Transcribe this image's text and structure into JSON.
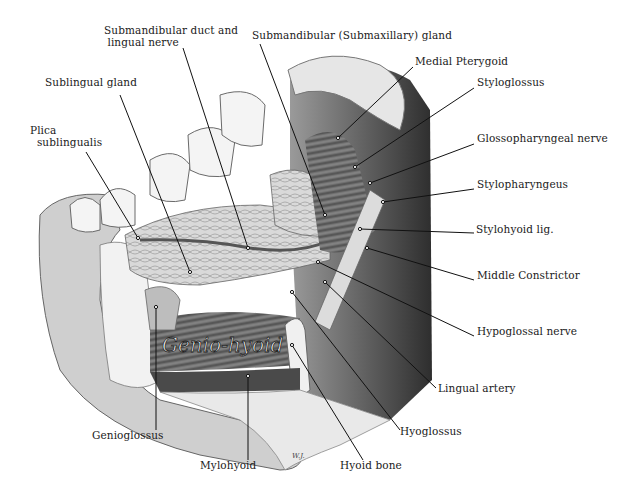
{
  "figure": {
    "painted_label": "Genio-hyoid",
    "signature": "W.J.",
    "colors": {
      "background": "#ffffff",
      "ink": "#1a1a1a",
      "shade_dark": "#3a3a3a",
      "shade_mid": "#8a8a8a",
      "shade_light": "#d6d6d6"
    }
  },
  "labels": [
    {
      "id": "submandibular-duct-lingual-nerve",
      "text": "Submandibular duct and\n lingual nerve",
      "x": 104,
      "y": 30,
      "anchor": [
        248,
        248
      ],
      "from": [
        183,
        48
      ]
    },
    {
      "id": "submandibular-gland",
      "text": "Submandibular (Submaxillary) gland",
      "x": 252,
      "y": 35,
      "anchor": [
        325,
        215
      ],
      "from": [
        260,
        44
      ]
    },
    {
      "id": "sublingual-gland",
      "text": "Sublingual gland",
      "x": 45,
      "y": 82,
      "anchor": [
        190,
        272
      ],
      "from": [
        120,
        95
      ]
    },
    {
      "id": "plica-sublingualis",
      "text": "Plica\n  sublingualis",
      "x": 30,
      "y": 130,
      "anchor": [
        138,
        238
      ],
      "from": [
        86,
        152
      ]
    },
    {
      "id": "medial-pterygoid",
      "text": "Medial Pterygoid",
      "x": 415,
      "y": 61,
      "anchor": [
        338,
        138
      ],
      "from": [
        413,
        67
      ]
    },
    {
      "id": "styloglossus",
      "text": "Styloglossus",
      "x": 477,
      "y": 82,
      "anchor": [
        355,
        167
      ],
      "from": [
        474,
        88
      ]
    },
    {
      "id": "glossopharyngeal-nerve",
      "text": "Glossopharyngeal nerve",
      "x": 477,
      "y": 138,
      "anchor": [
        370,
        183
      ],
      "from": [
        474,
        144
      ]
    },
    {
      "id": "stylopharyngeus",
      "text": "Stylopharyngeus",
      "x": 477,
      "y": 184,
      "anchor": [
        383,
        202
      ],
      "from": [
        474,
        189
      ]
    },
    {
      "id": "stylohoid-lig",
      "text": "Stylohyoid lig.",
      "x": 476,
      "y": 229,
      "anchor": [
        360,
        229
      ],
      "from": [
        474,
        233
      ]
    },
    {
      "id": "middle-constrictor",
      "text": "Middle Constrictor",
      "x": 477,
      "y": 275,
      "anchor": [
        367,
        248
      ],
      "from": [
        474,
        280
      ]
    },
    {
      "id": "hypoglossal-nerve",
      "text": "Hypoglossal nerve",
      "x": 477,
      "y": 331,
      "anchor": [
        318,
        262
      ],
      "from": [
        474,
        336
      ]
    },
    {
      "id": "lingual-artery",
      "text": "Lingual artery",
      "x": 438,
      "y": 388,
      "anchor": [
        325,
        282
      ],
      "from": [
        436,
        388
      ]
    },
    {
      "id": "hyoglossus",
      "text": "Hyoglossus",
      "x": 400,
      "y": 431,
      "anchor": [
        292,
        292
      ],
      "from": [
        400,
        430
      ]
    },
    {
      "id": "genioglossus",
      "text": "Genioglossus",
      "x": 92,
      "y": 435,
      "anchor": [
        156,
        307
      ],
      "from": [
        156,
        430
      ]
    },
    {
      "id": "mylohyoid",
      "text": "Mylohyoid",
      "x": 200,
      "y": 465,
      "anchor": [
        248,
        376
      ],
      "from": [
        248,
        460
      ]
    },
    {
      "id": "hyoid-bone",
      "text": "Hyoid bone",
      "x": 340,
      "y": 465,
      "anchor": [
        292,
        345
      ],
      "from": [
        363,
        460
      ]
    }
  ]
}
